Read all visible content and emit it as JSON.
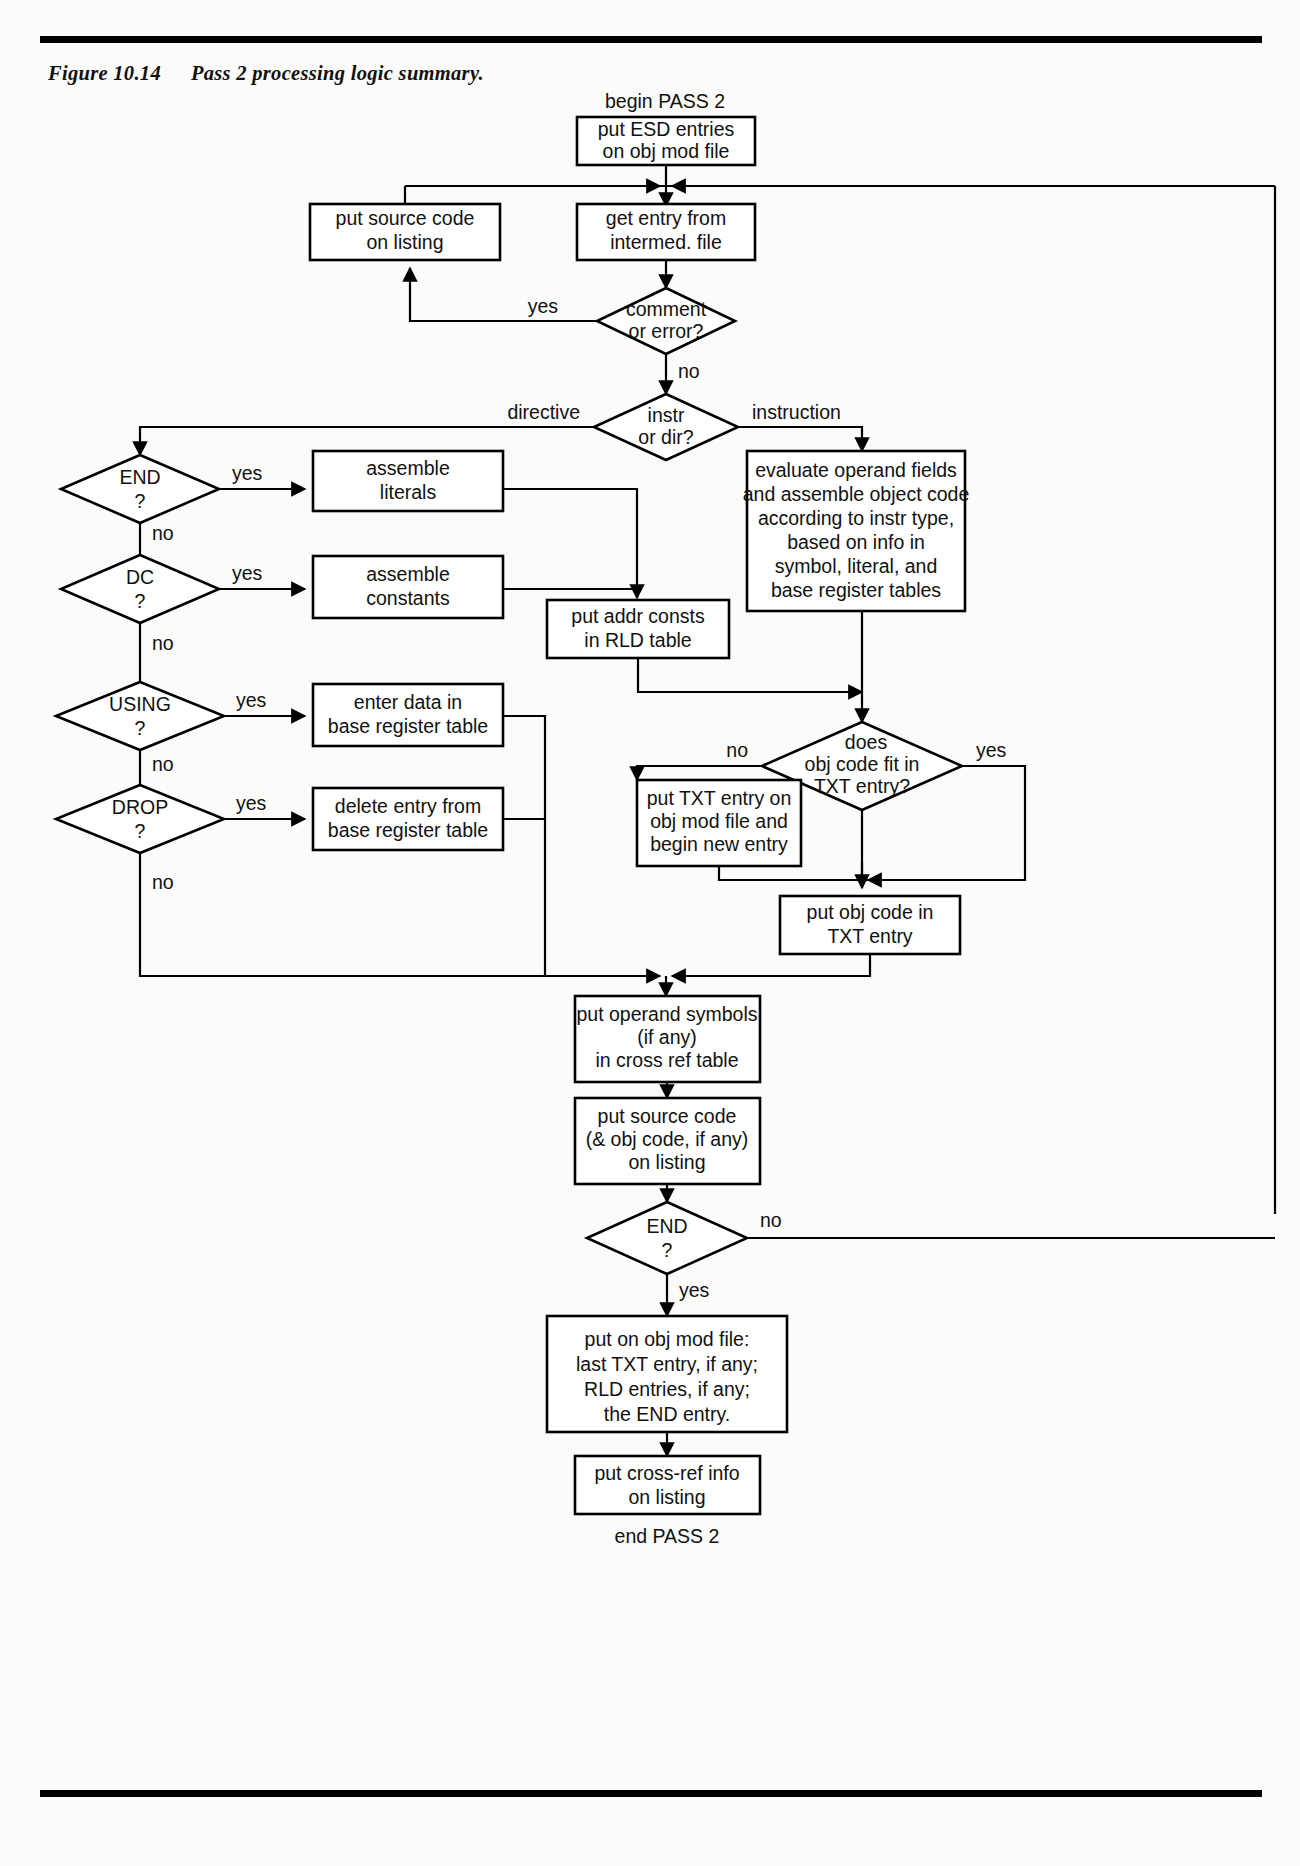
{
  "figure": {
    "number": "Figure 10.14",
    "title": "Pass 2 processing logic summary."
  },
  "terminals": {
    "begin": "begin PASS 2",
    "end": "end PASS 2"
  },
  "nodes": {
    "put_esd": {
      "lines": [
        "put ESD entries",
        "on obj mod file"
      ]
    },
    "put_source_listing": {
      "lines": [
        "put source code",
        "on listing"
      ]
    },
    "get_entry": {
      "lines": [
        "get entry from",
        "intermed. file"
      ]
    },
    "comment_or_error": {
      "lines": [
        "comment",
        "or error?"
      ]
    },
    "instr_or_dir": {
      "lines": [
        "instr",
        "or dir?"
      ]
    },
    "end_q1": {
      "lines": [
        "END",
        "?"
      ]
    },
    "dc_q": {
      "lines": [
        "DC",
        "?"
      ]
    },
    "using_q": {
      "lines": [
        "USING",
        "?"
      ]
    },
    "drop_q": {
      "lines": [
        "DROP",
        "?"
      ]
    },
    "assemble_literals": {
      "lines": [
        "assemble",
        "literals"
      ]
    },
    "assemble_constants": {
      "lines": [
        "assemble",
        "constants"
      ]
    },
    "enter_data": {
      "lines": [
        "enter data in",
        "base register table"
      ]
    },
    "delete_entry": {
      "lines": [
        "delete entry from",
        "base register table"
      ]
    },
    "put_addr_consts": {
      "lines": [
        "put addr consts",
        "in RLD table"
      ]
    },
    "evaluate_operand": {
      "lines": [
        "evaluate operand fields",
        "and assemble object code",
        "according to instr type,",
        "based on info in",
        "symbol, literal, and",
        "base register tables"
      ]
    },
    "obj_code_fit": {
      "lines": [
        "does",
        "obj code fit in",
        "TXT entry?"
      ]
    },
    "put_txt_entry": {
      "lines": [
        "put TXT entry on",
        "obj mod file and",
        "begin new entry"
      ]
    },
    "put_obj_code": {
      "lines": [
        "put obj code in",
        "TXT entry"
      ]
    },
    "put_operand_symbols": {
      "lines": [
        "put operand symbols",
        "(if any)",
        "in cross ref table"
      ]
    },
    "put_source_obj": {
      "lines": [
        "put source code",
        "(& obj code, if any)",
        "on listing"
      ]
    },
    "end_q2": {
      "lines": [
        "END",
        "?"
      ]
    },
    "put_on_obj_mod": {
      "lines": [
        "put on obj mod file:",
        "last TXT entry, if any;",
        "RLD entries, if any;",
        "the END entry."
      ]
    },
    "put_cross_ref": {
      "lines": [
        "put cross-ref info",
        "on listing"
      ]
    }
  },
  "edge_labels": {
    "comment_yes": "yes",
    "comment_no": "no",
    "directive": "directive",
    "instruction": "instruction",
    "end1_yes": "yes",
    "end1_no": "no",
    "dc_yes": "yes",
    "dc_no": "no",
    "using_yes": "yes",
    "using_no": "no",
    "drop_yes": "yes",
    "drop_no": "no",
    "fit_no": "no",
    "fit_yes": "yes",
    "end2_no": "no",
    "end2_yes": "yes"
  },
  "colors": {
    "line": "#000000",
    "text": "#111111",
    "background": "#fbfbf9",
    "node_fill": "#ffffff"
  }
}
